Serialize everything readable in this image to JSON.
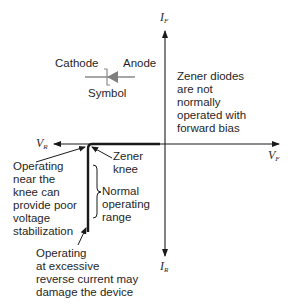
{
  "diagram": {
    "type": "zener-diode-characteristic",
    "axes": {
      "forward_current": {
        "symbol": "I",
        "subscript": "F"
      },
      "reverse_current": {
        "symbol": "I",
        "subscript": "R"
      },
      "forward_voltage": {
        "symbol": "V",
        "subscript": "F"
      },
      "reverse_voltage": {
        "symbol": "V",
        "subscript": "R"
      }
    },
    "symbol_block": {
      "cathode_label": "Cathode",
      "anode_label": "Anode",
      "caption": "Symbol"
    },
    "annotations": {
      "forward_note": "Zener diodes\nare not\nnormally\noperated with\nforward bias",
      "knee_label": "Zener\nknee",
      "knee_warning": "Operating\nnear the\nknee can\nprovide poor\nvoltage\nstabilization",
      "normal_range": "Normal\noperating\nrange",
      "excess_warning": "Operating\nat excessive\nreverse current may\ndamage the device"
    },
    "colors": {
      "line": "#1a1a1a",
      "symbol_gray": "#8a8a8a"
    }
  }
}
